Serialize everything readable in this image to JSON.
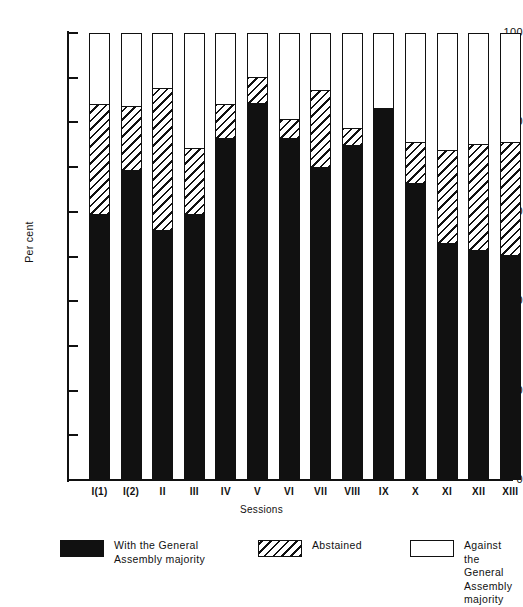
{
  "chart_data": {
    "type": "bar",
    "subtype": "stacked-bar-100-percent",
    "title": "",
    "xlabel": "Sessions",
    "ylabel": "Per cent",
    "ylim": [
      0,
      100
    ],
    "y_major_ticks": [
      0,
      20,
      40,
      60,
      80,
      100
    ],
    "y_minor_ticks": [
      10,
      30,
      50,
      70,
      90
    ],
    "y_tick_labels": [
      "0",
      "20",
      "40",
      "60",
      "80",
      "100"
    ],
    "grid": false,
    "legend_position": "below",
    "categories": [
      "I(1)",
      "I(2)",
      "II",
      "III",
      "IV",
      "V",
      "VI",
      "VII",
      "VIII",
      "IX",
      "X",
      "XI",
      "XII",
      "XIII"
    ],
    "series": [
      {
        "name": "With the General Assembly majority",
        "fill": "solid-black",
        "color": "#111111",
        "values": [
          59,
          69,
          55.5,
          59,
          76,
          84,
          76,
          69.5,
          74.5,
          83,
          66,
          52.5,
          51,
          50
        ]
      },
      {
        "name": "Abstained",
        "fill": "diagonal-hatch",
        "color": "#111111",
        "values": [
          25,
          14.5,
          32,
          15,
          8,
          6,
          4.5,
          17.5,
          4,
          0,
          9.5,
          21,
          24,
          25.5
        ]
      },
      {
        "name": "Against the General Assembly majority",
        "fill": "white",
        "color": "#ffffff",
        "values": [
          16,
          16.5,
          12.5,
          26,
          16,
          10,
          19.5,
          13,
          21.5,
          17,
          24.5,
          26.5,
          25,
          24.5
        ]
      }
    ],
    "cumulative_tops": {
      "with": [
        59,
        69,
        55.5,
        59,
        76,
        84,
        76,
        69.5,
        74.5,
        83,
        66,
        52.5,
        51,
        50
      ],
      "with_plus_abstained": [
        84,
        83.5,
        87.5,
        74,
        84,
        90,
        80.5,
        87,
        78.5,
        83,
        75.5,
        73.5,
        75,
        75.5
      ]
    }
  },
  "axes": {
    "y_title": "Per cent",
    "x_title": "Sessions"
  },
  "legend": {
    "items": [
      {
        "label": "With the General\nAssembly majority",
        "swatch": "solid-black-swatch"
      },
      {
        "label": "Abstained",
        "swatch": "hatched-swatch"
      },
      {
        "label": "Against the General\nAssembly majority",
        "swatch": "white-swatch"
      }
    ]
  }
}
